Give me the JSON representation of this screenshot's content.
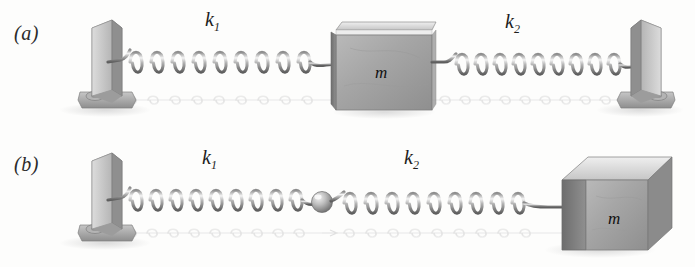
{
  "figure": {
    "type": "physics-diagram",
    "background_color": "#fdfdfc"
  },
  "panels": [
    {
      "id": "a",
      "label": "(a)",
      "arrangement": "mass between two springs anchored to two walls",
      "springs": [
        {
          "name": "k1",
          "label_text": "k",
          "subscript": "1",
          "coils": 9
        },
        {
          "name": "k2",
          "label_text": "k",
          "subscript": "2",
          "coils": 9
        }
      ],
      "mass": {
        "label": "m",
        "shape": "cube-front"
      },
      "anchors": [
        "left-wall-bracket",
        "right-wall-bracket"
      ]
    },
    {
      "id": "b",
      "label": "(b)",
      "arrangement": "two springs in series from wall to mass joined by a bead",
      "springs": [
        {
          "name": "k1",
          "label_text": "k",
          "subscript": "1",
          "coils": 9
        },
        {
          "name": "k2",
          "label_text": "k",
          "subscript": "2",
          "coils": 9
        }
      ],
      "mass": {
        "label": "m",
        "shape": "cube-3d"
      },
      "anchors": [
        "left-wall-bracket"
      ],
      "connector": "bead"
    }
  ],
  "colors": {
    "spring_dark": "#6f6f6f",
    "spring_light": "#d8d8d8",
    "spring_highlight": "#f2f2f2",
    "block_face": "#a8a8a8",
    "block_top": "#d2d2d2",
    "block_side": "#7b7b7b",
    "anchor_light": "#cfcfcf",
    "anchor_mid": "#a5a5a5",
    "anchor_dark": "#7d7d7d",
    "shadow": "#e2e2e2",
    "text": "#1d1d1d"
  },
  "labels": {
    "panel_a": "(a)",
    "panel_b": "(b)",
    "k1_a": "k",
    "k1_a_sub": "1",
    "k2_a": "k",
    "k2_a_sub": "2",
    "k1_b": "k",
    "k1_b_sub": "1",
    "k2_b": "k",
    "k2_b_sub": "2",
    "m_a": "m",
    "m_b": "m"
  }
}
